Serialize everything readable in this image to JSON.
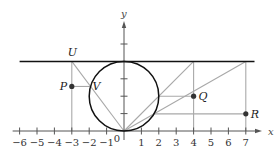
{
  "figure": {
    "axes": {
      "x_label": "x",
      "y_label": "y",
      "origin_label": "0",
      "x_ticks": [
        {
          "value": -6,
          "label": "−6"
        },
        {
          "value": -5,
          "label": "−5"
        },
        {
          "value": -4,
          "label": "−4"
        },
        {
          "value": -3,
          "label": "−3"
        },
        {
          "value": -2,
          "label": "−2"
        },
        {
          "value": -1,
          "label": "−1"
        },
        {
          "value": 1,
          "label": "1"
        },
        {
          "value": 2,
          "label": "2"
        },
        {
          "value": 3,
          "label": "3"
        },
        {
          "value": 4,
          "label": "4"
        },
        {
          "value": 5,
          "label": "5"
        },
        {
          "value": 6,
          "label": "6"
        },
        {
          "value": 7,
          "label": "7"
        }
      ],
      "y_ticks": [
        1,
        2,
        3,
        4,
        5
      ]
    },
    "circle": {
      "center": [
        0,
        2
      ],
      "radius": 2
    },
    "horizontal_line": {
      "y": 4,
      "x_from": -6,
      "x_to": 7.5
    },
    "points": {
      "U": {
        "label": "U",
        "x": -3,
        "y": 4
      },
      "V": {
        "label": "V",
        "x": -1.92,
        "y": 2.56
      },
      "P": {
        "label": "P",
        "x": -3,
        "y": 2.56
      },
      "Q": {
        "label": "Q",
        "x": 4,
        "y": 2
      },
      "R": {
        "label": "R",
        "x": 7,
        "y": 0.985
      }
    },
    "colors": {
      "axis": "#555555",
      "curve": "#111111",
      "construction": "#a8a8a8",
      "point": "#333333"
    }
  }
}
